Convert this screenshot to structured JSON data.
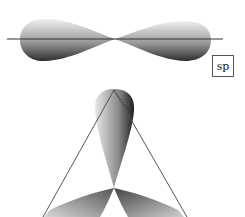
{
  "diagram": {
    "sp": {
      "label": "sp",
      "description": "sp hybrid orbital: two lobes along a horizontal axis"
    },
    "sp2": {
      "description": "sp2 hybrid orbitals: three lobes in trigonal planar arrangement with triangle outline"
    },
    "colors": {
      "lobe_dark": "#3a3a3a",
      "lobe_light": "#e6e6e6",
      "axis_line": "#333333",
      "triangle_line": "#555555"
    }
  }
}
